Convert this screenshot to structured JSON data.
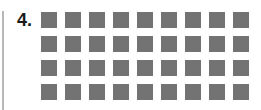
{
  "item": {
    "number_label": "4.",
    "grid": {
      "rows": 4,
      "columns": 9,
      "total": 36,
      "square_color": "#737373"
    }
  }
}
